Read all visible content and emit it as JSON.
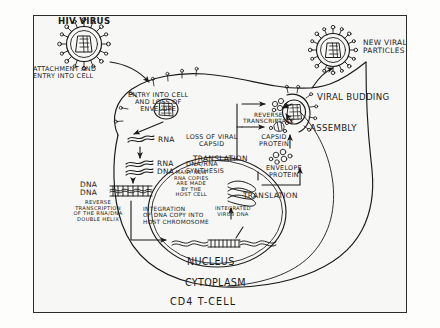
{
  "diagram": {
    "title": "CD4 T-CELL",
    "caption_bottom": "CD4 T-CELL",
    "colors": {
      "ink": "#1a1a1a",
      "page": "#f7f7f5",
      "frame": "#2b2b2b",
      "background": "#fdfdfc"
    }
  },
  "labels": {
    "hiv_virus": "HIV VIRUS",
    "attachment": "ATTACHMENT AND\nENTRY INTO CELL",
    "entry_loss_envelope": "ENTRY INTO CELL\nAND LOSS OF\nENVELOPE",
    "rna": "RNA",
    "loss_of_viral_capsid": "LOSS OF VIRAL\nCAPSID",
    "rna_dna_pair": "RNA\nDNA",
    "dna_rna_synthesis": "DNA/RNA\nSYNTHESIS",
    "dna_dna_pair": "DNA\nDNA",
    "reverse_transcription": "REVERSE\nTRANSCRIPTION\nOF THE RNA/DNA\nDOUBLE HELIX",
    "integration": "INTEGRATION\nOF DNA COPY INTO\nHOST CHROMOSOME",
    "integrated_virus_dna": "INTEGRATED\nVIRUS DNA",
    "many_new_rna": "MANY NEW\nRNA COPIES\nARE MADE\nBY THE\nHOST CELL",
    "translation_left": "TRANSLATION",
    "translation_right": "TRANSLATION",
    "reverse_transcriptase": "REVERSE\nTRANSCRIPTASE",
    "capsid_protein": "CAPSID\nPROTEIN",
    "envelope_protein": "ENVELOPE\nPROTEIN",
    "viral_budding": "VIRAL BUDDING",
    "assembly": "ASSEMBLY",
    "new_viral_particles": "NEW VIRAL\nPARTICLES",
    "nucleus": "NUCLEUS",
    "cytoplasm": "CYTOPLASM",
    "cd4_t_cell": "CD4 T-CELL"
  },
  "icons": {
    "virus_particle_top_left": "hiv-virion-icon",
    "virus_particle_top_right": "hiv-virion-icon",
    "virus_particle_entering": "hiv-virion-icon",
    "virus_particle_budding": "hiv-virion-icon"
  }
}
